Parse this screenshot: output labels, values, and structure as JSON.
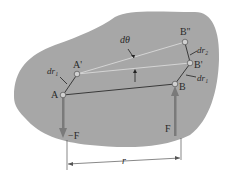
{
  "diagram": {
    "colors": {
      "body_fill": "#a7a7a7",
      "line": "#3a3a3a",
      "thin_line": "#d8d8d8",
      "force_arrow": "#7a7a7a",
      "point_fill": "#d0d0d0"
    },
    "points": {
      "A": "A",
      "A_prime": "A'",
      "B": "B",
      "B_prime": "B'",
      "B_double_prime": "B''"
    },
    "labels": {
      "dtheta": "dθ",
      "dr1_left": "dr₁",
      "dr1_right": "dr₁",
      "dr2": "dr₂",
      "force_left": "−F",
      "force_right": "F",
      "distance": "r"
    }
  }
}
